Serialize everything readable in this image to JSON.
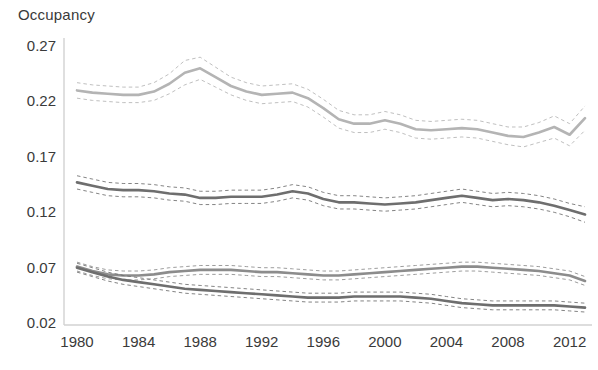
{
  "chart_data": {
    "type": "line",
    "title": "",
    "subtitle": "",
    "ylabel": "Occupancy",
    "xlabel": "",
    "ylim": [
      0.02,
      0.27
    ],
    "xlim": [
      1980,
      2013
    ],
    "grid": false,
    "legend": false,
    "yticks": [
      0.27,
      0.22,
      0.17,
      0.12,
      0.07,
      0.02
    ],
    "ytick_labels": [
      "0.27",
      "0.22",
      "0.17",
      "0.12",
      "0.07",
      "0.02"
    ],
    "xticks": [
      1980,
      1984,
      1988,
      1992,
      1996,
      2000,
      2004,
      2008,
      2012
    ],
    "xtick_labels": [
      "1980",
      "1984",
      "1988",
      "1992",
      "1996",
      "2000",
      "2004",
      "2008",
      "2012"
    ],
    "x": [
      1980,
      1981,
      1982,
      1983,
      1984,
      1985,
      1986,
      1987,
      1988,
      1989,
      1990,
      1991,
      1992,
      1993,
      1994,
      1995,
      1996,
      1997,
      1998,
      1999,
      2000,
      2001,
      2002,
      2003,
      2004,
      2005,
      2006,
      2007,
      2008,
      2009,
      2010,
      2011,
      2012,
      2013
    ],
    "annotations": [],
    "series": [
      {
        "name": "series-upper",
        "color": "#b4b4b4",
        "style": "solid",
        "values": [
          0.229,
          0.227,
          0.226,
          0.225,
          0.225,
          0.228,
          0.235,
          0.245,
          0.249,
          0.241,
          0.233,
          0.228,
          0.225,
          0.226,
          0.227,
          0.222,
          0.213,
          0.203,
          0.199,
          0.199,
          0.202,
          0.199,
          0.194,
          0.193,
          0.194,
          0.195,
          0.194,
          0.191,
          0.188,
          0.187,
          0.191,
          0.196,
          0.189,
          0.204
        ],
        "ci_upper": [
          0.236,
          0.234,
          0.233,
          0.232,
          0.232,
          0.236,
          0.244,
          0.256,
          0.259,
          0.25,
          0.241,
          0.236,
          0.233,
          0.234,
          0.235,
          0.23,
          0.221,
          0.211,
          0.207,
          0.207,
          0.21,
          0.207,
          0.202,
          0.201,
          0.202,
          0.203,
          0.202,
          0.199,
          0.196,
          0.196,
          0.2,
          0.206,
          0.199,
          0.215
        ],
        "ci_lower": [
          0.222,
          0.22,
          0.219,
          0.218,
          0.218,
          0.22,
          0.226,
          0.234,
          0.239,
          0.232,
          0.225,
          0.22,
          0.217,
          0.218,
          0.219,
          0.214,
          0.205,
          0.195,
          0.191,
          0.191,
          0.194,
          0.191,
          0.186,
          0.185,
          0.186,
          0.187,
          0.186,
          0.183,
          0.18,
          0.178,
          0.182,
          0.186,
          0.179,
          0.193
        ]
      },
      {
        "name": "series-middle",
        "color": "#6e6e6e",
        "style": "solid",
        "values": [
          0.146,
          0.143,
          0.14,
          0.139,
          0.139,
          0.138,
          0.136,
          0.135,
          0.132,
          0.132,
          0.133,
          0.133,
          0.133,
          0.135,
          0.138,
          0.136,
          0.131,
          0.128,
          0.128,
          0.127,
          0.126,
          0.127,
          0.128,
          0.13,
          0.132,
          0.134,
          0.132,
          0.13,
          0.131,
          0.13,
          0.128,
          0.125,
          0.121,
          0.117
        ],
        "ci_upper": [
          0.152,
          0.149,
          0.146,
          0.145,
          0.145,
          0.144,
          0.142,
          0.141,
          0.138,
          0.138,
          0.139,
          0.139,
          0.139,
          0.141,
          0.144,
          0.142,
          0.137,
          0.134,
          0.134,
          0.133,
          0.132,
          0.133,
          0.134,
          0.136,
          0.138,
          0.14,
          0.138,
          0.136,
          0.137,
          0.136,
          0.134,
          0.131,
          0.127,
          0.124
        ],
        "ci_lower": [
          0.14,
          0.137,
          0.134,
          0.133,
          0.133,
          0.132,
          0.13,
          0.129,
          0.126,
          0.126,
          0.127,
          0.127,
          0.127,
          0.129,
          0.132,
          0.13,
          0.125,
          0.122,
          0.122,
          0.121,
          0.12,
          0.121,
          0.122,
          0.124,
          0.126,
          0.128,
          0.126,
          0.124,
          0.125,
          0.124,
          0.122,
          0.119,
          0.115,
          0.11
        ]
      },
      {
        "name": "series-lower-a",
        "color": "#8c8c8c",
        "style": "solid",
        "values": [
          0.07,
          0.066,
          0.063,
          0.062,
          0.062,
          0.063,
          0.065,
          0.066,
          0.067,
          0.067,
          0.067,
          0.066,
          0.065,
          0.065,
          0.064,
          0.063,
          0.062,
          0.062,
          0.063,
          0.064,
          0.065,
          0.066,
          0.067,
          0.068,
          0.069,
          0.07,
          0.07,
          0.069,
          0.068,
          0.067,
          0.066,
          0.064,
          0.062,
          0.057
        ],
        "ci_upper": [
          0.074,
          0.07,
          0.067,
          0.066,
          0.066,
          0.067,
          0.069,
          0.07,
          0.071,
          0.071,
          0.071,
          0.07,
          0.069,
          0.069,
          0.068,
          0.067,
          0.066,
          0.066,
          0.067,
          0.068,
          0.069,
          0.07,
          0.071,
          0.072,
          0.073,
          0.074,
          0.074,
          0.073,
          0.072,
          0.071,
          0.07,
          0.068,
          0.066,
          0.061
        ],
        "ci_lower": [
          0.066,
          0.062,
          0.059,
          0.058,
          0.058,
          0.059,
          0.061,
          0.062,
          0.063,
          0.063,
          0.063,
          0.062,
          0.061,
          0.061,
          0.06,
          0.059,
          0.058,
          0.058,
          0.059,
          0.06,
          0.061,
          0.062,
          0.063,
          0.064,
          0.065,
          0.066,
          0.066,
          0.065,
          0.064,
          0.063,
          0.062,
          0.06,
          0.058,
          0.053
        ]
      },
      {
        "name": "series-lower-b",
        "color": "#6e6e6e",
        "style": "solid",
        "values": [
          0.069,
          0.065,
          0.061,
          0.058,
          0.056,
          0.054,
          0.052,
          0.05,
          0.049,
          0.048,
          0.047,
          0.046,
          0.045,
          0.044,
          0.043,
          0.042,
          0.042,
          0.042,
          0.043,
          0.043,
          0.043,
          0.043,
          0.042,
          0.041,
          0.039,
          0.037,
          0.036,
          0.035,
          0.035,
          0.035,
          0.035,
          0.035,
          0.034,
          0.033
        ],
        "ci_upper": [
          0.073,
          0.069,
          0.065,
          0.062,
          0.06,
          0.058,
          0.056,
          0.054,
          0.053,
          0.052,
          0.051,
          0.05,
          0.049,
          0.048,
          0.047,
          0.046,
          0.046,
          0.046,
          0.047,
          0.047,
          0.047,
          0.047,
          0.046,
          0.045,
          0.043,
          0.041,
          0.04,
          0.039,
          0.039,
          0.039,
          0.039,
          0.039,
          0.038,
          0.037
        ],
        "ci_lower": [
          0.065,
          0.061,
          0.057,
          0.054,
          0.052,
          0.05,
          0.048,
          0.046,
          0.045,
          0.044,
          0.043,
          0.042,
          0.041,
          0.04,
          0.039,
          0.038,
          0.038,
          0.038,
          0.039,
          0.039,
          0.039,
          0.039,
          0.038,
          0.037,
          0.035,
          0.033,
          0.032,
          0.031,
          0.031,
          0.031,
          0.031,
          0.031,
          0.03,
          0.029
        ]
      }
    ]
  }
}
